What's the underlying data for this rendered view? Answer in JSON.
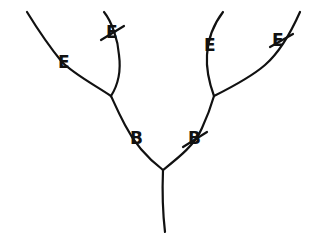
{
  "diagram": {
    "type": "hand-drawn branching tree",
    "stroke_color": "#111111",
    "background": "#ffffff",
    "labels": [
      {
        "id": "left-outer-E",
        "text": "E",
        "crossed_out": false,
        "x": 58,
        "y": 54
      },
      {
        "id": "left-inner-E",
        "text": "E",
        "crossed_out": true,
        "x": 106,
        "y": 24
      },
      {
        "id": "right-inner-E",
        "text": "E",
        "crossed_out": false,
        "x": 204,
        "y": 37
      },
      {
        "id": "right-outer-E",
        "text": "E",
        "crossed_out": true,
        "x": 272,
        "y": 32
      },
      {
        "id": "left-B",
        "text": "B",
        "crossed_out": false,
        "x": 130,
        "y": 130
      },
      {
        "id": "right-B",
        "text": "B",
        "crossed_out": true,
        "x": 188,
        "y": 130
      }
    ]
  }
}
